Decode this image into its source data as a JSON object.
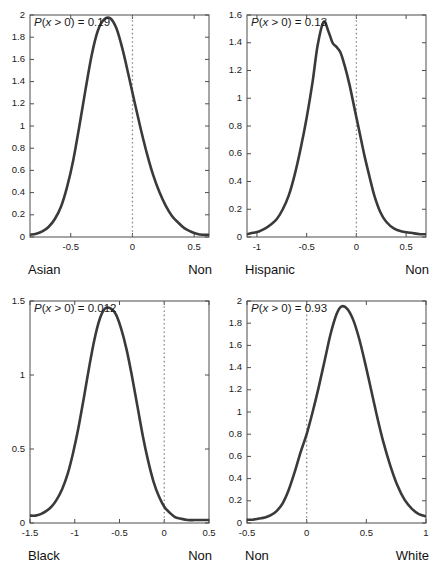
{
  "figure": {
    "background": "#ffffff",
    "curve_color": "#3a3a3a",
    "axis_color": "#4d4d4d",
    "zeroline_color": "#8c8c8c"
  },
  "chart_data": [
    {
      "type": "line",
      "panel_index": 0,
      "title": "",
      "annotation": "P(x > 0) = 0.19",
      "annotation_prefix": "P",
      "annotation_var": "x",
      "annotation_rest": " > 0) = ",
      "annotation_value": "0.19",
      "probability": 0.19,
      "xlabel": "",
      "ylabel": "",
      "left_end_label": "Asian",
      "right_end_label": "Non",
      "xlim": [
        -0.83,
        0.62
      ],
      "ylim": [
        0,
        2
      ],
      "xticks": [
        -0.5,
        0,
        0.5
      ],
      "xticklabels": [
        "-0.5",
        "0",
        "0.5"
      ],
      "yticks": [
        0,
        0.2,
        0.4,
        0.6,
        0.8,
        1,
        1.2,
        1.4,
        1.6,
        1.8,
        2
      ],
      "yticklabels": [
        "0",
        "0.2",
        "0.4",
        "0.6",
        "0.8",
        "1",
        "1.2",
        "1.4",
        "1.6",
        "1.8",
        "2"
      ],
      "grid": false,
      "zero_reference_line": 0,
      "peak_x": -0.17,
      "peak_y": 1.97,
      "x": [
        -0.83,
        -0.78,
        -0.73,
        -0.68,
        -0.63,
        -0.58,
        -0.53,
        -0.48,
        -0.43,
        -0.38,
        -0.33,
        -0.28,
        -0.23,
        -0.18,
        -0.13,
        -0.08,
        -0.03,
        0.02,
        0.07,
        0.12,
        0.17,
        0.22,
        0.27,
        0.32,
        0.37,
        0.42,
        0.47,
        0.52,
        0.57,
        0.62
      ],
      "y": [
        0.02,
        0.03,
        0.05,
        0.09,
        0.16,
        0.27,
        0.45,
        0.69,
        1.0,
        1.33,
        1.64,
        1.86,
        1.96,
        1.97,
        1.88,
        1.69,
        1.45,
        1.2,
        0.96,
        0.74,
        0.55,
        0.4,
        0.28,
        0.19,
        0.13,
        0.08,
        0.05,
        0.03,
        0.02,
        0.02
      ]
    },
    {
      "type": "line",
      "panel_index": 1,
      "title": "",
      "annotation": "P(x > 0) = 0.13",
      "annotation_prefix": "P",
      "annotation_var": "x",
      "annotation_rest": " > 0) = ",
      "annotation_value": "0.13",
      "probability": 0.13,
      "xlabel": "",
      "ylabel": "",
      "left_end_label": "Hispanic",
      "right_end_label": "Non",
      "xlim": [
        -1.1,
        0.7
      ],
      "ylim": [
        0,
        1.6
      ],
      "xticks": [
        -1,
        -0.5,
        0,
        0.5
      ],
      "xticklabels": [
        "-1",
        "-0.5",
        "0",
        "0.5"
      ],
      "yticks": [
        0,
        0.2,
        0.4,
        0.6,
        0.8,
        1,
        1.2,
        1.4,
        1.6
      ],
      "yticklabels": [
        "0",
        "0.2",
        "0.4",
        "0.6",
        "0.8",
        "1",
        "1.2",
        "1.4",
        "1.6"
      ],
      "grid": false,
      "zero_reference_line": 0,
      "peak_x": -0.33,
      "peak_y": 1.55,
      "x": [
        -1.1,
        -1.04,
        -0.98,
        -0.92,
        -0.86,
        -0.8,
        -0.74,
        -0.68,
        -0.62,
        -0.56,
        -0.5,
        -0.44,
        -0.39,
        -0.33,
        -0.28,
        -0.24,
        -0.2,
        -0.16,
        -0.12,
        -0.07,
        -0.02,
        0.03,
        0.08,
        0.13,
        0.18,
        0.24,
        0.3,
        0.38,
        0.46,
        0.55,
        0.64,
        0.7
      ],
      "y": [
        0.02,
        0.03,
        0.04,
        0.06,
        0.09,
        0.13,
        0.2,
        0.3,
        0.45,
        0.64,
        0.86,
        1.12,
        1.38,
        1.55,
        1.48,
        1.4,
        1.37,
        1.33,
        1.24,
        1.1,
        0.93,
        0.76,
        0.59,
        0.44,
        0.3,
        0.18,
        0.11,
        0.06,
        0.04,
        0.03,
        0.02,
        0.02
      ]
    },
    {
      "type": "line",
      "panel_index": 2,
      "title": "",
      "annotation": "P(x > 0) = 0.012",
      "annotation_prefix": "P",
      "annotation_var": "x",
      "annotation_rest": " > 0) = ",
      "annotation_value": "0.012",
      "probability": 0.012,
      "xlabel": "",
      "ylabel": "",
      "left_end_label": "Black",
      "right_end_label": "Non",
      "xlim": [
        -1.5,
        0.5
      ],
      "ylim": [
        0,
        1.5
      ],
      "xticks": [
        -1.5,
        -1,
        -0.5,
        0,
        0.5
      ],
      "xticklabels": [
        "-1.5",
        "-1",
        "-0.5",
        "0",
        "0.5"
      ],
      "yticks": [
        0,
        0.5,
        1,
        1.5
      ],
      "yticklabels": [
        "0",
        "0.5",
        "1",
        "1.5"
      ],
      "grid": false,
      "zero_reference_line": 0,
      "peak_x": -0.6,
      "peak_y": 1.45,
      "x": [
        -1.5,
        -1.44,
        -1.38,
        -1.32,
        -1.26,
        -1.2,
        -1.14,
        -1.08,
        -1.02,
        -0.96,
        -0.9,
        -0.84,
        -0.78,
        -0.72,
        -0.66,
        -0.6,
        -0.54,
        -0.48,
        -0.42,
        -0.36,
        -0.3,
        -0.24,
        -0.18,
        -0.12,
        -0.06,
        0.0,
        0.06,
        0.12,
        0.18,
        0.26,
        0.34,
        0.42,
        0.5
      ],
      "y": [
        0.05,
        0.05,
        0.06,
        0.08,
        0.11,
        0.16,
        0.23,
        0.33,
        0.47,
        0.64,
        0.84,
        1.05,
        1.24,
        1.38,
        1.45,
        1.45,
        1.41,
        1.31,
        1.17,
        0.99,
        0.79,
        0.59,
        0.42,
        0.28,
        0.18,
        0.11,
        0.07,
        0.04,
        0.03,
        0.02,
        0.02,
        0.02,
        0.02
      ]
    },
    {
      "type": "line",
      "panel_index": 3,
      "title": "",
      "annotation": "P(x > 0) = 0.93",
      "annotation_prefix": "P",
      "annotation_var": "x",
      "annotation_rest": " > 0) = ",
      "annotation_value": "0.93",
      "probability": 0.93,
      "xlabel": "",
      "ylabel": "",
      "left_end_label": "Non",
      "right_end_label": "White",
      "xlim": [
        -0.5,
        1.0
      ],
      "ylim": [
        0,
        2
      ],
      "xticks": [
        -0.5,
        0,
        0.5,
        1
      ],
      "xticklabels": [
        "-0.5",
        "0",
        "0.5",
        "1"
      ],
      "yticks": [
        0,
        0.2,
        0.4,
        0.6,
        0.8,
        1,
        1.2,
        1.4,
        1.6,
        1.8,
        2
      ],
      "yticklabels": [
        "0",
        "0.2",
        "0.4",
        "0.6",
        "0.8",
        "1",
        "1.2",
        "1.4",
        "1.6",
        "1.8",
        "2"
      ],
      "grid": false,
      "zero_reference_line": 0,
      "peak_x": 0.29,
      "peak_y": 1.95,
      "x": [
        -0.5,
        -0.45,
        -0.4,
        -0.35,
        -0.3,
        -0.25,
        -0.2,
        -0.15,
        -0.1,
        -0.05,
        0.0,
        0.05,
        0.1,
        0.15,
        0.2,
        0.25,
        0.29,
        0.34,
        0.39,
        0.44,
        0.49,
        0.54,
        0.59,
        0.64,
        0.7,
        0.76,
        0.82,
        0.88,
        0.94,
        1.0
      ],
      "y": [
        0.03,
        0.03,
        0.04,
        0.05,
        0.07,
        0.11,
        0.18,
        0.3,
        0.46,
        0.64,
        0.8,
        1.0,
        1.22,
        1.46,
        1.7,
        1.88,
        1.95,
        1.93,
        1.83,
        1.66,
        1.44,
        1.2,
        0.96,
        0.74,
        0.52,
        0.34,
        0.21,
        0.13,
        0.08,
        0.06
      ]
    }
  ]
}
